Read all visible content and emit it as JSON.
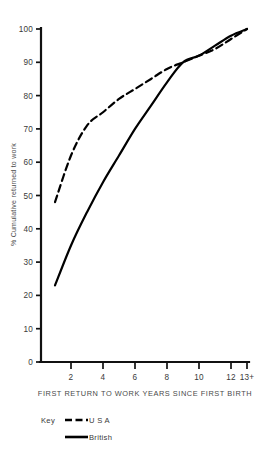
{
  "chart_data": {
    "type": "line",
    "title": "",
    "subtitle": "",
    "xlabel": "FIRST RETURN TO WORK YEARS SINCE FIRST BIRTH",
    "ylabel": "% Cumulative returned to work",
    "x": [
      1,
      2,
      3,
      4,
      5,
      6,
      7,
      8,
      9,
      10,
      11,
      12,
      13
    ],
    "xlim": [
      0,
      13
    ],
    "ylim": [
      0,
      100
    ],
    "grid": false,
    "legend_position": "bottom-left",
    "legend_title": "Key",
    "x_tick_values": [
      2,
      4,
      6,
      8,
      10,
      12,
      13
    ],
    "x_tick_labels": [
      "2",
      "4",
      "6",
      "8",
      "10",
      "12",
      "13+"
    ],
    "y_tick_values": [
      0,
      10,
      20,
      30,
      40,
      50,
      60,
      70,
      80,
      90,
      100
    ],
    "y_tick_labels": [
      "0",
      "10",
      "20",
      "30",
      "40",
      "50",
      "60",
      "70",
      "80",
      "90",
      "100"
    ],
    "series": [
      {
        "name": "U S A",
        "style": "dashed",
        "color": "#000000",
        "values": [
          48,
          62,
          71,
          75,
          79,
          82,
          85,
          88,
          90,
          92,
          94,
          97,
          100
        ]
      },
      {
        "name": "British",
        "style": "solid",
        "color": "#000000",
        "values": [
          23,
          35,
          45,
          54,
          62,
          70,
          77,
          84,
          90,
          92,
          95,
          98,
          100
        ]
      }
    ]
  },
  "axes": {
    "y_title": "% Cumulative returned to work",
    "x_title": "FIRST RETURN TO WORK YEARS SINCE FIRST BIRTH"
  },
  "legend": {
    "key_label": "Key",
    "entries": [
      {
        "label": "U S A",
        "style": "dashed"
      },
      {
        "label": "British",
        "style": "solid"
      }
    ]
  }
}
